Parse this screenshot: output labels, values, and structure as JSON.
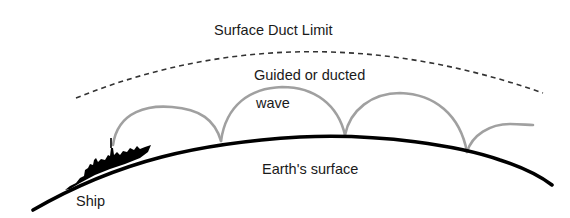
{
  "diagram": {
    "labels": {
      "duct_limit": "Surface Duct Limit",
      "guided_line1": "Guided or ducted",
      "guided_line2": "wave",
      "earth": "Earth's surface",
      "ship": "Ship"
    },
    "colors": {
      "earth": "#000000",
      "wave": "#a0a0a0",
      "duct": "#333333",
      "text": "#1a1a1a"
    }
  }
}
